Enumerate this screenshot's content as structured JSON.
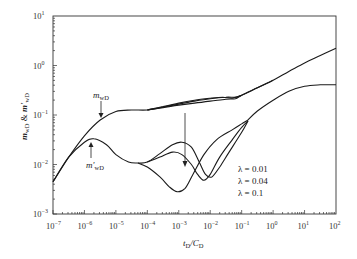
{
  "chart_data": {
    "type": "line",
    "title": "",
    "xlabel": "tD/CD",
    "xlabel_main": "t",
    "xlabel_sub": "D",
    "xlabel_div": "/C",
    "xlabel_sub2": "D",
    "ylabel": "mwD & m'wD",
    "xscale": "log",
    "yscale": "log",
    "xlim": [
      1e-07,
      100
    ],
    "ylim": [
      0.001,
      10
    ],
    "grid": false,
    "x_ticks": [
      "10-7",
      "10-6",
      "10-5",
      "10-4",
      "10-3",
      "10-2",
      "10-1",
      "100",
      "101",
      "102"
    ],
    "x_tick_exponents": [
      -7,
      -6,
      -5,
      -4,
      -3,
      -2,
      -1,
      0,
      1,
      2
    ],
    "y_tick_exponents": [
      1,
      0,
      -1,
      -2,
      -3
    ],
    "annotations": [
      {
        "text": "mwD",
        "arrow_to": [
          3e-06,
          0.11
        ]
      },
      {
        "text": "m'wD",
        "arrow_to": [
          2.5e-06,
          0.033
        ]
      },
      {
        "text": "λ = 0.01"
      },
      {
        "text": "λ = 0.04"
      },
      {
        "text": "λ = 0.1"
      },
      {
        "text": "arrow: increasing λ",
        "arrow_at_x": 0.001
      }
    ],
    "legend": [
      "λ = 0.01",
      "λ = 0.04",
      "λ = 0.1"
    ],
    "series": [
      {
        "name": "mwD (λ=0.01)",
        "points": [
          [
            -7,
            -2.35
          ],
          [
            -6.5,
            -1.85
          ],
          [
            -6,
            -1.42
          ],
          [
            -5.5,
            -1.1
          ],
          [
            -5,
            -0.93
          ],
          [
            -4.5,
            -0.9
          ],
          [
            -4,
            -0.9
          ],
          [
            -3.5,
            -0.85
          ],
          [
            -3,
            -0.8
          ],
          [
            -2.5,
            -0.76
          ],
          [
            -2,
            -0.72
          ],
          [
            -1.5,
            -0.68
          ],
          [
            -1.2,
            -0.67
          ],
          [
            -1,
            -0.6
          ],
          [
            -0.5,
            -0.45
          ],
          [
            0,
            -0.3
          ],
          [
            0.5,
            -0.12
          ],
          [
            1,
            0.05
          ],
          [
            1.5,
            0.2
          ],
          [
            2,
            0.35
          ]
        ]
      },
      {
        "name": "mwD (λ=0.04)",
        "points": [
          [
            -4,
            -0.9
          ],
          [
            -3.5,
            -0.84
          ],
          [
            -3,
            -0.78
          ],
          [
            -2.5,
            -0.72
          ],
          [
            -2,
            -0.67
          ],
          [
            -1.5,
            -0.64
          ],
          [
            -1.2,
            -0.64
          ],
          [
            -1,
            -0.6
          ],
          [
            -0.5,
            -0.45
          ],
          [
            0,
            -0.3
          ]
        ]
      },
      {
        "name": "mwD (λ=0.1)",
        "points": [
          [
            -4,
            -0.9
          ],
          [
            -3.5,
            -0.83
          ],
          [
            -3,
            -0.76
          ],
          [
            -2.5,
            -0.7
          ],
          [
            -2,
            -0.66
          ],
          [
            -1.6,
            -0.64
          ],
          [
            -1.3,
            -0.66
          ],
          [
            -1,
            -0.6
          ]
        ]
      },
      {
        "name": "m'wD (λ=0.01)",
        "points": [
          [
            -7,
            -2.35
          ],
          [
            -6.5,
            -1.85
          ],
          [
            -6,
            -1.55
          ],
          [
            -5.7,
            -1.48
          ],
          [
            -5.3,
            -1.6
          ],
          [
            -5,
            -1.8
          ],
          [
            -4.6,
            -1.95
          ],
          [
            -4.3,
            -1.97
          ],
          [
            -4,
            -1.95
          ],
          [
            -3.6,
            -1.78
          ],
          [
            -3.2,
            -1.6
          ],
          [
            -2.9,
            -1.55
          ],
          [
            -2.6,
            -1.65
          ],
          [
            -2.35,
            -1.95
          ],
          [
            -2.15,
            -2.2
          ],
          [
            -1.95,
            -2.25
          ],
          [
            -1.7,
            -2.05
          ],
          [
            -1.4,
            -1.75
          ],
          [
            -1,
            -1.35
          ],
          [
            -0.8,
            -1.12
          ]
        ]
      },
      {
        "name": "m'wD (λ=0.04)",
        "points": [
          [
            -4,
            -1.95
          ],
          [
            -3.6,
            -1.85
          ],
          [
            -3.2,
            -1.75
          ],
          [
            -2.9,
            -1.8
          ],
          [
            -2.6,
            -2.0
          ],
          [
            -2.4,
            -2.2
          ],
          [
            -2.2,
            -2.32
          ],
          [
            -2.0,
            -2.2
          ],
          [
            -1.7,
            -1.85
          ],
          [
            -1.3,
            -1.5
          ],
          [
            -1,
            -1.25
          ],
          [
            -0.8,
            -1.12
          ]
        ]
      },
      {
        "name": "m'wD (λ=0.1)",
        "points": [
          [
            -4.3,
            -1.97
          ],
          [
            -4,
            -2.05
          ],
          [
            -3.6,
            -2.25
          ],
          [
            -3.3,
            -2.45
          ],
          [
            -3.05,
            -2.55
          ],
          [
            -2.8,
            -2.48
          ],
          [
            -2.55,
            -2.2
          ],
          [
            -2.2,
            -1.8
          ],
          [
            -1.8,
            -1.5
          ],
          [
            -1.3,
            -1.3
          ],
          [
            -1,
            -1.18
          ],
          [
            -0.8,
            -1.1
          ]
        ]
      },
      {
        "name": "m'wD tail",
        "points": [
          [
            -0.8,
            -1.1
          ],
          [
            -0.5,
            -0.92
          ],
          [
            0,
            -0.7
          ],
          [
            0.5,
            -0.52
          ],
          [
            1,
            -0.42
          ],
          [
            1.5,
            -0.39
          ],
          [
            2,
            -0.39
          ]
        ]
      }
    ]
  },
  "labels": {
    "y_axis_m": "m",
    "y_axis_sub": "wD",
    "y_axis_amp": " & ",
    "y_axis_m2": "m'",
    "y_axis_sub2": "wD",
    "annot_mwd": "m",
    "annot_mwd_sub": "wD",
    "annot_mpwd": "m'",
    "annot_mpwd_sub": "wD",
    "lambda1": "λ = 0.01",
    "lambda2": "λ = 0.04",
    "lambda3": "λ = 0.1",
    "ten": "10"
  }
}
